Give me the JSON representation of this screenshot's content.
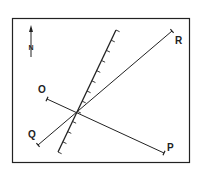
{
  "diagram": {
    "type": "geologic-map-sketch",
    "frame": {
      "x": 12,
      "y": 18,
      "width": 178,
      "height": 145,
      "stroke": "#222222"
    },
    "north_arrow": {
      "label": "N",
      "x": 31,
      "y_top": 26,
      "y_bottom": 57
    },
    "fault_line": {
      "name": "hatched-line",
      "x1": 116,
      "y1": 30,
      "x2": 58,
      "y2": 152,
      "ticks": 12
    },
    "lines": [
      {
        "id": "QR",
        "from_label": "Q",
        "to_label": "R",
        "x1": 38,
        "y1": 145,
        "x2": 172,
        "y2": 31
      },
      {
        "id": "OP",
        "from_label": "O",
        "to_label": "P",
        "x1": 47,
        "y1": 99,
        "x2": 164,
        "y2": 153
      }
    ],
    "labels": [
      {
        "text": "R",
        "x": 175,
        "y": 44
      },
      {
        "text": "O",
        "x": 38,
        "y": 93
      },
      {
        "text": "Q",
        "x": 28,
        "y": 138
      },
      {
        "text": "P",
        "x": 167,
        "y": 151
      }
    ]
  }
}
